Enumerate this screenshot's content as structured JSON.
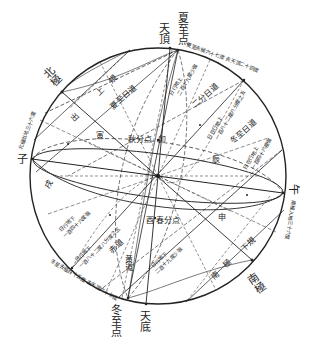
{
  "colors": {
    "ink": "#222222",
    "background": "#ffffff"
  },
  "geometry": {
    "center": [
      158,
      176
    ],
    "radius": 128
  },
  "labels": {
    "zenith": "天頂",
    "nadir": "天底",
    "summer_solstice_point": "夏至点",
    "winter_solstice_point": "冬至点",
    "north_pole": "北極",
    "south_pole": "南極",
    "zi": "子",
    "wu": "午",
    "yin": "寅",
    "xu": "戌",
    "chen": "辰",
    "shen": "申",
    "autumn_equinox": "秋分点",
    "spring_equinox": "春分点",
    "you": "酉",
    "mao": "卯",
    "north_pole_upper": "北極上規",
    "north_pole_upper_left": "出",
    "north_pole_upper_mid": "上",
    "north_pole_upper_right": "規",
    "south_pole_lower_left": "南",
    "south_pole_lower_mid": "極",
    "south_pole_lower_right": "下規",
    "summer_sun_path": "夏至日道",
    "equinox_sun_path": "二分日道",
    "winter_sun_path": "冬至日道",
    "equator": "赤道",
    "ecliptic": "黄道",
    "summer_above": "日在地上行一百八十二度八分度之五",
    "summer_above_a": "日行地上",
    "summer_above_b": "二百十九度少強",
    "equinox_above_a": "日在行地上",
    "equinox_above_b": "一百八十二度八分度之五",
    "winter_above_a": "日在行地上",
    "winter_above_b": "一百四十六度強",
    "summer_below_a": "日行地下",
    "summer_below_b": "一百四十六度強",
    "equinox_below_a": "日行地下",
    "equinox_below_b": "一百八十二度八分度之五",
    "winter_below_a": "日行地下",
    "winter_below_b": "二百十九度少強",
    "arc_top_right": "夏至去極六十七度 去天頂二十四度",
    "arc_left": "北極出地三十六度",
    "arc_bottom_left": "冬至去極百十五度 去天頂六十七度",
    "arc_right": "南極入地三十六度"
  }
}
